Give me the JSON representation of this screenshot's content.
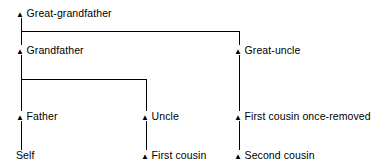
{
  "diagram": {
    "marker_glyph": "▲",
    "marker_name": "triangle-marker-icon",
    "line_color": "#000000",
    "text_color": "#000000",
    "background_color": "#ffffff",
    "nodes": [
      {
        "id": "great-grandfather",
        "label": "Great-grandfather",
        "marker": true,
        "column": 1,
        "row": 1
      },
      {
        "id": "grandfather",
        "label": "Grandfather",
        "marker": true,
        "column": 1,
        "row": 2
      },
      {
        "id": "great-uncle",
        "label": "Great-uncle",
        "marker": true,
        "column": 3,
        "row": 2
      },
      {
        "id": "father",
        "label": "Father",
        "marker": true,
        "column": 1,
        "row": 3
      },
      {
        "id": "uncle",
        "label": "Uncle",
        "marker": true,
        "column": 2,
        "row": 3
      },
      {
        "id": "first-cousin-once-removed",
        "label": "First cousin once-removed",
        "marker": true,
        "column": 3,
        "row": 3
      },
      {
        "id": "self",
        "label": "Self",
        "marker": false,
        "column": 1,
        "row": 4
      },
      {
        "id": "first-cousin",
        "label": "First cousin",
        "marker": true,
        "column": 2,
        "row": 4
      },
      {
        "id": "second-cousin",
        "label": "Second cousin",
        "marker": true,
        "column": 3,
        "row": 4
      }
    ],
    "edges": [
      {
        "id": "edge-greatgrandfather-grandfather",
        "from": "great-grandfather",
        "to": "grandfather"
      },
      {
        "id": "edge-greatgrandfather-greatuncle",
        "from": "great-grandfather",
        "to": "great-uncle"
      },
      {
        "id": "edge-grandfather-father",
        "from": "grandfather",
        "to": "father"
      },
      {
        "id": "edge-grandfather-uncle",
        "from": "grandfather",
        "to": "uncle"
      },
      {
        "id": "edge-greatuncle-firstcousinonceremoved",
        "from": "great-uncle",
        "to": "first-cousin-once-removed"
      },
      {
        "id": "edge-father-self",
        "from": "father",
        "to": "self"
      },
      {
        "id": "edge-uncle-firstcousin",
        "from": "uncle",
        "to": "first-cousin"
      },
      {
        "id": "edge-firstcousinonceremoved-secondcousin",
        "from": "first-cousin-once-removed",
        "to": "second-cousin"
      }
    ]
  }
}
